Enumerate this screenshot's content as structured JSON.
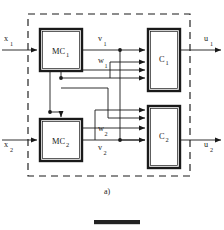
{
  "figure": {
    "caption": "a)",
    "blocks": [
      {
        "id": "mc1",
        "label": "MC",
        "sub": "1",
        "x": 40,
        "y": 29,
        "w": 42,
        "h": 42
      },
      {
        "id": "mc2",
        "label": "MC",
        "sub": "2",
        "x": 40,
        "y": 119,
        "w": 42,
        "h": 42
      },
      {
        "id": "c1",
        "label": "C",
        "sub": "1",
        "x": 148,
        "y": 29,
        "w": 32,
        "h": 62
      },
      {
        "id": "c2",
        "label": "C",
        "sub": "2",
        "x": 148,
        "y": 106,
        "w": 32,
        "h": 62
      }
    ],
    "signals": {
      "x1": {
        "label": "x",
        "sub": "1"
      },
      "x2": {
        "label": "x",
        "sub": "2"
      },
      "v1": {
        "label": "v",
        "sub": "1"
      },
      "v2": {
        "label": "v",
        "sub": "2"
      },
      "w1": {
        "label": "w",
        "sub": "1"
      },
      "w2": {
        "label": "w",
        "sub": "2"
      },
      "u1": {
        "label": "u",
        "sub": "1"
      },
      "u2": {
        "label": "u",
        "sub": "2"
      }
    },
    "boundary": {
      "x": 28,
      "y": 14,
      "w": 162,
      "h": 162,
      "style": "dashed"
    },
    "colors": {
      "line": "#1a1a1a",
      "background": "#ffffff",
      "bar": "#222222"
    }
  }
}
